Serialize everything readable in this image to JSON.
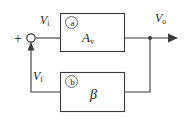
{
  "figure": {
    "kind": "block-diagram",
    "background_color": "#ffffff",
    "line_color": "#3a3a3a",
    "text_color": "#1a1a1a",
    "tag_circle_color": "#6e6e6e"
  },
  "signals": {
    "input": {
      "symbol": "V",
      "subscript": "i",
      "text": "Vi"
    },
    "output": {
      "symbol": "V",
      "subscript": "o",
      "text": "Vo"
    },
    "feedback": {
      "symbol": "V",
      "subscript": "f",
      "text": "Vf"
    },
    "summing_sign": "+"
  },
  "blocks": [
    {
      "id": "amplifier",
      "tag": "a",
      "symbol": "A",
      "subscript": "v",
      "text": "Av",
      "role": "forward-gain-block"
    },
    {
      "id": "feedback-network",
      "tag": "b",
      "symbol": "β",
      "subscript": "",
      "text": "β",
      "role": "feedback-block"
    }
  ],
  "nodes": {
    "summing_junction": {
      "shape": "open-circle",
      "x": 31,
      "y": 38
    },
    "output_tap": {
      "shape": "filled-dot",
      "x": 150,
      "y": 38
    }
  },
  "arrows": [
    {
      "name": "feedback-into-summing-junction",
      "direction": "up"
    },
    {
      "name": "output-arrow",
      "direction": "right"
    }
  ]
}
